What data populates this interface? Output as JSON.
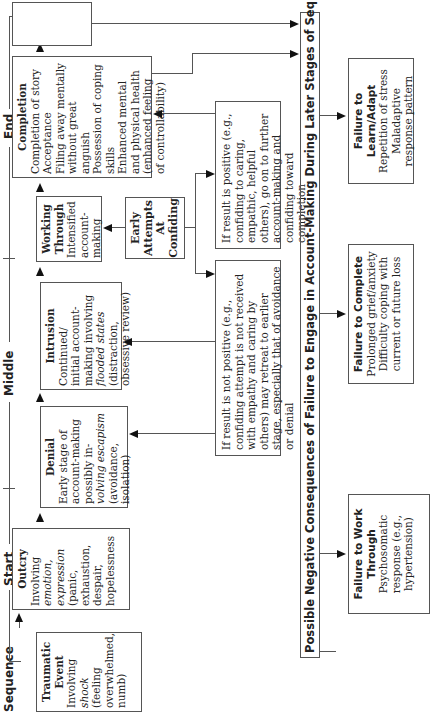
{
  "stages": {
    "sequence": "Sequence",
    "start": "Start",
    "middle": "Middle",
    "end": "End"
  },
  "boxes": {
    "traumatic_event": {
      "title": "Traumatic Event",
      "lines": [
        "Involving",
        "shock",
        "(feeling",
        "overwhelmed,",
        "numb)"
      ]
    },
    "outcry": {
      "title": "Outcry",
      "lines": [
        "Involving",
        "emotion,",
        "expression",
        "(panic,",
        "exhaustion,",
        "despair,",
        "hopelessness"
      ]
    },
    "denial": {
      "title": "Denial",
      "lines": [
        "Early stage of",
        "account-making",
        "possibly in-",
        "volving escapism",
        "(avoidance,",
        "isolation)"
      ]
    },
    "intrusion": {
      "title": "Intrusion",
      "lines": [
        "Continued/",
        "initial account-",
        "making involving",
        "flooded states",
        "(distraction,",
        "obsessive review)"
      ]
    },
    "working_through": {
      "title": "Working Through",
      "lines": [
        "Intensified",
        "account-",
        "making"
      ]
    },
    "completion": {
      "title": "Completion",
      "lines": [
        "Completion of story",
        "Acceptance",
        "Filing away mentally",
        "without great anguish",
        "Possession of coping skills",
        "Enhanced mental",
        "and physical health",
        "(enhanced feeling",
        "of controllability)"
      ]
    },
    "identity_change": {
      "title": "Identity Change",
      "lines": [
        "Behavioral",
        "expectations",
        "in line with",
        "account"
      ]
    },
    "early_attempts": {
      "title": "Early Attempts At Confiding"
    }
  },
  "notes": {
    "positive": "If result is positive (e.g., confiding to caring, empathic, helpful others), go on to further account-making and confiding toward completion",
    "negative": "If result is not positive (e.g., confiding attempt is not received with empathy and caring by others) may retreat to earlier stage, especially that of avoidance or denial"
  },
  "consequences": {
    "header": "Possible Negative Consequences of Failure to Engage in Account-Making During Later Stages of Sequence",
    "items": [
      {
        "title": "Failure to Work Through",
        "lines": [
          "Psychosomatic",
          "response (e.g.,",
          "hypertension)"
        ]
      },
      {
        "title": "Failure to Complete",
        "lines": [
          "Prolonged grief/anxiety",
          "Difficulty coping with",
          "current or future loss"
        ]
      },
      {
        "title": "Failure to Learn/Adapt",
        "lines": [
          "Repetition of stress",
          "Maladaptive",
          "response pattern"
        ]
      }
    ]
  }
}
